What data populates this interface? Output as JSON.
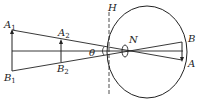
{
  "diagram": {
    "type": "eye-visual-angle",
    "labels": {
      "A1": {
        "main": "A",
        "sub": "1"
      },
      "B1": {
        "main": "B",
        "sub": "1"
      },
      "A2": {
        "main": "A",
        "sub": "2"
      },
      "B2": {
        "main": "B",
        "sub": "2"
      },
      "theta": "θ",
      "H": "H",
      "N": "N",
      "B": "B",
      "A": "A"
    },
    "colors": {
      "stroke": "#222222",
      "background": "#ffffff"
    }
  }
}
